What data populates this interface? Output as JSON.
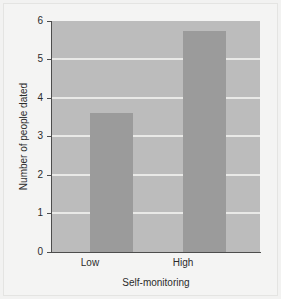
{
  "chart_data": {
    "type": "bar",
    "title": "",
    "categories": [
      "Low",
      "High"
    ],
    "values": [
      3.6,
      5.75
    ],
    "series": [
      {
        "name": "Number of people dated",
        "values": [
          3.6,
          5.75
        ]
      }
    ],
    "xlabel": "Self-monitoring",
    "ylabel": "Number of people dated",
    "ylim": [
      0,
      6
    ],
    "yticks": [
      0,
      1,
      2,
      3,
      4,
      5,
      6
    ],
    "ytick_labels": [
      "0",
      "1",
      "2",
      "3",
      "4",
      "5",
      "6"
    ],
    "grid": true,
    "grid_axis": "y",
    "legend": false,
    "legend_position": "none",
    "colors": {
      "bar": "#9b9b9b",
      "plot_background": "#bcbcbc",
      "figure_background": "#f2f2f1",
      "gridline": "#e9e9e7",
      "axis": "#4d4d4d",
      "text": "#2b2b2b"
    }
  }
}
